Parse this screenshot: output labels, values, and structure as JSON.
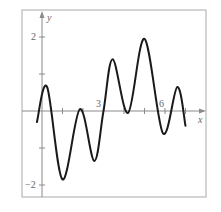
{
  "chart_data": {
    "type": "line",
    "title": "",
    "xlabel": "x",
    "ylabel": "y",
    "xlim": [
      -0.9,
      7.8
    ],
    "ylim": [
      -2.4,
      2.7
    ],
    "x_ticks": [
      1,
      2,
      3,
      4,
      5,
      6,
      7
    ],
    "x_tick_labels": {
      "3": "3",
      "6": "6"
    },
    "y_ticks": [
      -2,
      -1,
      1,
      2
    ],
    "y_tick_labels": {
      "2": "2",
      "-2": "−2"
    },
    "grid": false,
    "frame": true,
    "series": [
      {
        "name": "f(x)",
        "color": "#1a1a1a",
        "x": [
          -0.25,
          0.25,
          1.0,
          1.85,
          2.55,
          3.0,
          3.45,
          4.2,
          5.0,
          5.9,
          6.6,
          7.0
        ],
        "y": [
          -0.3,
          0.65,
          -1.85,
          0.05,
          -1.35,
          0.0,
          1.4,
          -0.05,
          1.95,
          -0.6,
          0.65,
          -0.4
        ]
      }
    ]
  },
  "labels": {
    "x_axis": "x",
    "y_axis": "y",
    "tick_3": "3",
    "tick_6": "6",
    "tick_2": "2",
    "tick_neg2": "−2"
  },
  "colors": {
    "frame": "#b8b8b8",
    "axis": "#8a8a8a",
    "curve": "#1a1a1a",
    "text": "#666666"
  }
}
